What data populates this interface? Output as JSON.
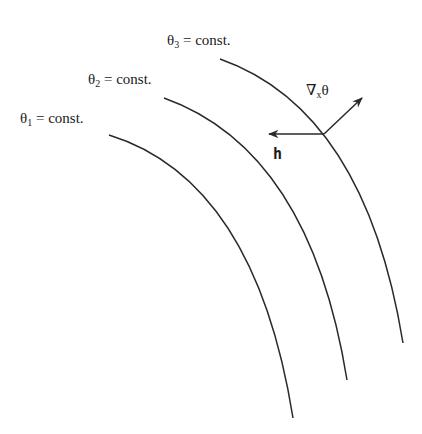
{
  "diagram": {
    "contours": [
      {
        "id": "theta1",
        "symbol": "θ",
        "subscript": "1",
        "label_rest": " = const."
      },
      {
        "id": "theta2",
        "symbol": "θ",
        "subscript": "2",
        "label_rest": " = const."
      },
      {
        "id": "theta3",
        "symbol": "θ",
        "subscript": "3",
        "label_rest": " = const."
      }
    ],
    "vectors": {
      "gradient": {
        "label_main": "∇",
        "label_sub": "x",
        "label_tail": "θ"
      },
      "h": {
        "label": "h"
      }
    },
    "colors": {
      "stroke": "#2a2a2a",
      "background": "#ffffff"
    }
  }
}
